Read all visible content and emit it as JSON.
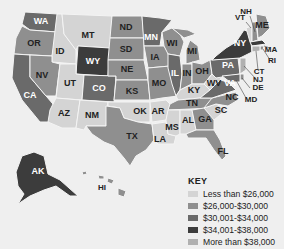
{
  "map": {
    "title": "Average income by state",
    "colors": {
      "bin1": "#d4d4d4",
      "bin2": "#8f8f8f",
      "bin3": "#6a6a6a",
      "bin4": "#3c3c3c",
      "bin5": "#b0b0b0"
    },
    "states": {
      "WA": {
        "label": "WA",
        "bin": 3
      },
      "OR": {
        "label": "OR",
        "bin": 2
      },
      "CA": {
        "label": "CA",
        "bin": 3
      },
      "ID": {
        "label": "ID",
        "bin": 1
      },
      "NV": {
        "label": "NV",
        "bin": 2
      },
      "MT": {
        "label": "MT",
        "bin": 1
      },
      "WY": {
        "label": "WY",
        "bin": 4
      },
      "UT": {
        "label": "UT",
        "bin": 1
      },
      "CO": {
        "label": "CO",
        "bin": 3
      },
      "AZ": {
        "label": "AZ",
        "bin": 1
      },
      "NM": {
        "label": "NM",
        "bin": 1
      },
      "ND": {
        "label": "ND",
        "bin": 2
      },
      "SD": {
        "label": "SD",
        "bin": 2
      },
      "NE": {
        "label": "NE",
        "bin": 2
      },
      "KS": {
        "label": "KS",
        "bin": 2
      },
      "OK": {
        "label": "OK",
        "bin": 1
      },
      "TX": {
        "label": "TX",
        "bin": 2
      },
      "MN": {
        "label": "MN",
        "bin": 3
      },
      "IA": {
        "label": "IA",
        "bin": 2
      },
      "MO": {
        "label": "MO",
        "bin": 2
      },
      "AR": {
        "label": "AR",
        "bin": 1
      },
      "LA": {
        "label": "LA",
        "bin": 1
      },
      "WI": {
        "label": "WI",
        "bin": 2
      },
      "IL": {
        "label": "IL",
        "bin": 3
      },
      "MI": {
        "label": "MI",
        "bin": 2
      },
      "IN": {
        "label": "IN",
        "bin": 2
      },
      "OH": {
        "label": "OH",
        "bin": 2
      },
      "KY": {
        "label": "KY",
        "bin": 1
      },
      "TN": {
        "label": "TN",
        "bin": 2
      },
      "MS": {
        "label": "MS",
        "bin": 1
      },
      "AL": {
        "label": "AL",
        "bin": 1
      },
      "GA": {
        "label": "GA",
        "bin": 2
      },
      "FL": {
        "label": "FL",
        "bin": 2
      },
      "SC": {
        "label": "SC",
        "bin": 1
      },
      "NC": {
        "label": "NC",
        "bin": 2
      },
      "VA": {
        "label": "VA",
        "bin": 3
      },
      "WV": {
        "label": "WV",
        "bin": 1
      },
      "PA": {
        "label": "PA",
        "bin": 3
      },
      "NY": {
        "label": "NY",
        "bin": 4
      },
      "VT": {
        "label": "VT",
        "bin": 1
      },
      "NH": {
        "label": "NH",
        "bin": 2
      },
      "ME": {
        "label": "ME",
        "bin": 2
      },
      "MA": {
        "label": "MA",
        "bin": 4
      },
      "RI": {
        "label": "RI",
        "bin": 2
      },
      "CT": {
        "label": "CT",
        "bin": 5
      },
      "NJ": {
        "label": "NJ",
        "bin": 5
      },
      "DE": {
        "label": "DE",
        "bin": 2
      },
      "MD": {
        "label": "MD",
        "bin": 3
      },
      "AK": {
        "label": "AK",
        "bin": 4
      },
      "HI": {
        "label": "HI",
        "bin": 2
      }
    }
  },
  "key": {
    "title": "KEY",
    "items": [
      {
        "label": "Less than $26,000",
        "color": "#d4d4d4"
      },
      {
        "label": "$26,000-$30,000",
        "color": "#8f8f8f"
      },
      {
        "label": "$30,001-$34,000",
        "color": "#6a6a6a"
      },
      {
        "label": "$34,001-$38,000",
        "color": "#3c3c3c"
      },
      {
        "label": "More than $38,000",
        "color": "#b0b0b0"
      }
    ]
  }
}
